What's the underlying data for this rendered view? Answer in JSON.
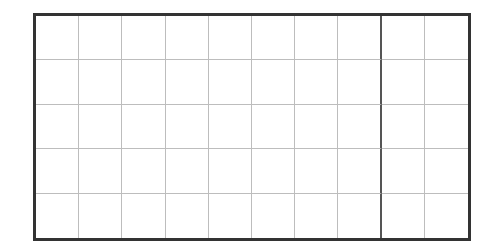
{
  "grid": {
    "columns": 10,
    "rows": 5,
    "border_color": "#333333",
    "line_color": "#bdbdbd",
    "emphasized_line_color": "#555555",
    "emphasized_column_line_after": 8
  }
}
